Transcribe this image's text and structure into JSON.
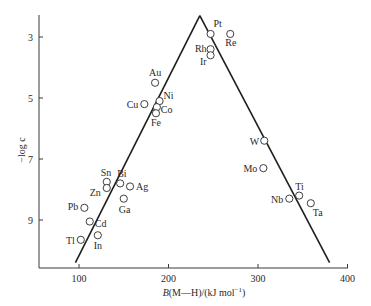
{
  "chart_data": {
    "type": "scatter",
    "title": "",
    "xlabel": "B(M—H)/(kJ mol⁻¹)",
    "ylabel": "−log c",
    "xlim": [
      40,
      400
    ],
    "ylim": [
      10.5,
      2.1
    ],
    "y_inverted": true,
    "grid": false,
    "legend": null,
    "x_ticks": [
      100,
      200,
      300,
      400
    ],
    "y_ticks": [
      3,
      5,
      7,
      9
    ],
    "points": [
      {
        "label": "Pt",
        "x": 247,
        "y": 2.9
      },
      {
        "label": "Re",
        "x": 269,
        "y": 2.9
      },
      {
        "label": "Rh",
        "x": 247,
        "y": 3.4
      },
      {
        "label": "Ir",
        "x": 247,
        "y": 3.6
      },
      {
        "label": "Au",
        "x": 185,
        "y": 4.5
      },
      {
        "label": "Cu",
        "x": 173,
        "y": 5.2
      },
      {
        "label": "Ni",
        "x": 190,
        "y": 5.1
      },
      {
        "label": "Co",
        "x": 187,
        "y": 5.3
      },
      {
        "label": "Fe",
        "x": 186,
        "y": 5.5
      },
      {
        "label": "W",
        "x": 307,
        "y": 6.4
      },
      {
        "label": "Mo",
        "x": 306,
        "y": 7.3
      },
      {
        "label": "Sn",
        "x": 131,
        "y": 7.75
      },
      {
        "label": "Zn",
        "x": 131,
        "y": 7.95
      },
      {
        "label": "Bi",
        "x": 146,
        "y": 7.8
      },
      {
        "label": "Ag",
        "x": 157,
        "y": 7.9
      },
      {
        "label": "Ga",
        "x": 150,
        "y": 8.3
      },
      {
        "label": "Pb",
        "x": 106,
        "y": 8.6
      },
      {
        "label": "Cd",
        "x": 112,
        "y": 9.05
      },
      {
        "label": "Tl",
        "x": 102,
        "y": 9.65
      },
      {
        "label": "In",
        "x": 121,
        "y": 9.5
      },
      {
        "label": "Ti",
        "x": 346,
        "y": 8.2
      },
      {
        "label": "Nb",
        "x": 335,
        "y": 8.3
      },
      {
        "label": "Ta",
        "x": 359,
        "y": 8.45
      }
    ],
    "fit_lines": [
      {
        "name": "ascending",
        "from": {
          "x": 96,
          "y": 10.4
        },
        "to": {
          "x": 235,
          "y": 2.3
        }
      },
      {
        "name": "descending",
        "from": {
          "x": 235,
          "y": 2.3
        },
        "to": {
          "x": 380,
          "y": 10.4
        }
      }
    ],
    "annotations": "Volcano plot: activity peak near Pt/Rh/Ir"
  },
  "labels": {
    "y_axis_title": "−log c",
    "x_axis_title_prefix": "B",
    "x_axis_title_rest": "(M—H)/(kJ mol",
    "x_axis_title_sup": "−1",
    "x_axis_title_end": ")"
  },
  "layout": {
    "line_color": "#1e1e1e",
    "marker_stroke": "#2a2a2a",
    "marker_fill": "#ffffff",
    "px": {
      "x_axis_y": 268,
      "y_axis_x": 39,
      "y_axis_top": 15,
      "x_axis_right": 348,
      "x100": 79,
      "x_per_unit": 0.895,
      "y3": 37,
      "y_per_unit": 30.5
    },
    "label_offsets": {
      "Pt": [
        3,
        -7,
        "start"
      ],
      "Re": [
        -5,
        12,
        "start"
      ],
      "Rh": [
        -4,
        3,
        "end"
      ],
      "Ir": [
        -4,
        10,
        "end"
      ],
      "Au": [
        -6,
        -7,
        "start"
      ],
      "Cu": [
        -6,
        4,
        "end"
      ],
      "Ni": [
        4,
        -2,
        "start"
      ],
      "Co": [
        4,
        6,
        "start"
      ],
      "Fe": [
        -5,
        13,
        "start"
      ],
      "W": [
        -5,
        4,
        "end"
      ],
      "Mo": [
        -6,
        4,
        "end"
      ],
      "Sn": [
        -6,
        -6,
        "start"
      ],
      "Zn": [
        -6,
        8,
        "end"
      ],
      "Bi": [
        -3,
        -6,
        "start"
      ],
      "Ag": [
        6,
        4,
        "start"
      ],
      "Ga": [
        -5,
        14,
        "start"
      ],
      "Pb": [
        -6,
        2,
        "end"
      ],
      "Cd": [
        5,
        5,
        "start"
      ],
      "Tl": [
        -6,
        4,
        "end"
      ],
      "In": [
        -4,
        14,
        "start"
      ],
      "Ti": [
        -4,
        -6,
        "start"
      ],
      "Nb": [
        -6,
        4,
        "end"
      ],
      "Ta": [
        2,
        13,
        "start"
      ]
    }
  }
}
